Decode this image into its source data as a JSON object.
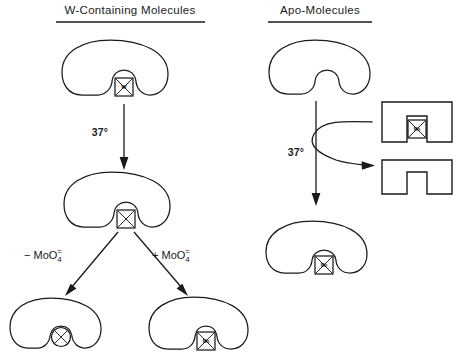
{
  "figure": {
    "background_color": "#ffffff",
    "line_color": "#1a1a1a"
  },
  "panels": {
    "left": {
      "title": "W-Containing Molecules",
      "steps": {
        "temperature": "37°",
        "branch_left_label": {
          "sign": "− MoO",
          "subscript": "4",
          "superscript": "="
        },
        "branch_right_label": {
          "sign": "+ MoO",
          "subscript": "4",
          "superscript": "="
        }
      },
      "molecules": [
        {
          "name": "w-containing-molecule",
          "site_type": "square-cross",
          "site_label": "W"
        },
        {
          "name": "empty-site-molecule",
          "site_type": "square-cross",
          "site_label": ""
        },
        {
          "name": "inactivated-molecule",
          "site_type": "circle-cross",
          "site_label": ""
        },
        {
          "name": "mo-containing-molecule",
          "site_type": "square-cross",
          "site_label": "Mo"
        }
      ]
    },
    "right": {
      "title": "Apo-Molecules",
      "steps": {
        "temperature": "37°"
      },
      "molecules": [
        {
          "name": "apo-molecule",
          "site_type": "none",
          "site_label": ""
        },
        {
          "name": "mo-reconstituted-molecule",
          "site_type": "square-cross",
          "site_label": "Mo"
        }
      ],
      "blocks": [
        {
          "name": "mo-loaded-block",
          "site_type": "square-cross",
          "site_label": "Mo"
        },
        {
          "name": "empty-block",
          "site_type": "none",
          "site_label": ""
        }
      ]
    }
  }
}
